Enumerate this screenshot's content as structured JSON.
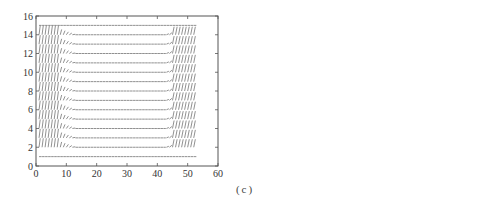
{
  "figure": {
    "caption": "(c)"
  },
  "chart_data": [
    {
      "type": "quiver",
      "panel": "left",
      "title": "",
      "xlabel": "",
      "ylabel": "",
      "xlim": [
        0,
        60
      ],
      "ylim": [
        0,
        16
      ],
      "xticks": [
        0,
        10,
        20,
        30,
        40,
        50,
        60
      ],
      "yticks": [
        0,
        2,
        4,
        6,
        8,
        10,
        12,
        14,
        16
      ],
      "grid": false,
      "description": "Vector field on a ~52 x 15 grid; near-horizontal arrows in rows y=1..15 with steep near-vertical arrows in columns x≈0-7 and x≈45-52, and a slanted transition band near x≈7-12",
      "grid_x_range": [
        1,
        52
      ],
      "grid_y_range": [
        1,
        15
      ],
      "rows_y": [
        1,
        2,
        3,
        4,
        5,
        6,
        7,
        8,
        9,
        10,
        11,
        12,
        13,
        14,
        15
      ],
      "left_band_x": [
        0,
        7
      ],
      "right_band_x": [
        45,
        52
      ]
    },
    {
      "type": "quiver",
      "panel": "right",
      "title": "",
      "xlabel": "",
      "ylabel": "",
      "xlim": [
        0,
        60
      ],
      "ylim": [
        0,
        60
      ],
      "xticks": [
        0,
        10,
        20,
        30,
        40,
        50,
        60
      ],
      "yticks": [
        0,
        10,
        20,
        30,
        40,
        50,
        60
      ],
      "grid": false,
      "description": "Dense vector field on a ~52 x 52 grid; faint dots outside, darker horizontal arrows inside a hexagonal region centered near (27, 26)",
      "grid_x_range": [
        0,
        52
      ],
      "grid_y_range": [
        0,
        52
      ],
      "hexagon_vertices": [
        [
          16,
          43
        ],
        [
          38,
          43
        ],
        [
          47,
          26
        ],
        [
          38,
          9
        ],
        [
          16,
          9
        ],
        [
          7,
          26
        ]
      ]
    }
  ]
}
